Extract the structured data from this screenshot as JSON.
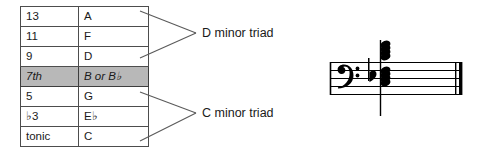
{
  "table": {
    "columns": [
      "degree",
      "note"
    ],
    "rows": [
      {
        "degree": "13",
        "note": "A",
        "highlight": false
      },
      {
        "degree": "11",
        "note": "F",
        "highlight": false
      },
      {
        "degree": "9",
        "note": "D",
        "highlight": false
      },
      {
        "degree": "7th",
        "note": "B or B♭",
        "highlight": true
      },
      {
        "degree": "5",
        "note": "G",
        "highlight": false
      },
      {
        "degree": "♭3",
        "note": "E♭",
        "highlight": false
      },
      {
        "degree": "tonic",
        "note": "C",
        "highlight": false
      }
    ],
    "highlight_color": "#b8b8b8",
    "border_color": "#4d4d4d"
  },
  "annotations": {
    "upper_bracket_label": "D minor triad",
    "lower_bracket_label": "C minor triad",
    "bracket_color": "#5a5a5a"
  },
  "staff": {
    "clef": "bass-clef",
    "accidental": "flat",
    "barline": "final-double-barline",
    "line_count": 5,
    "ink_color": "#000000"
  }
}
